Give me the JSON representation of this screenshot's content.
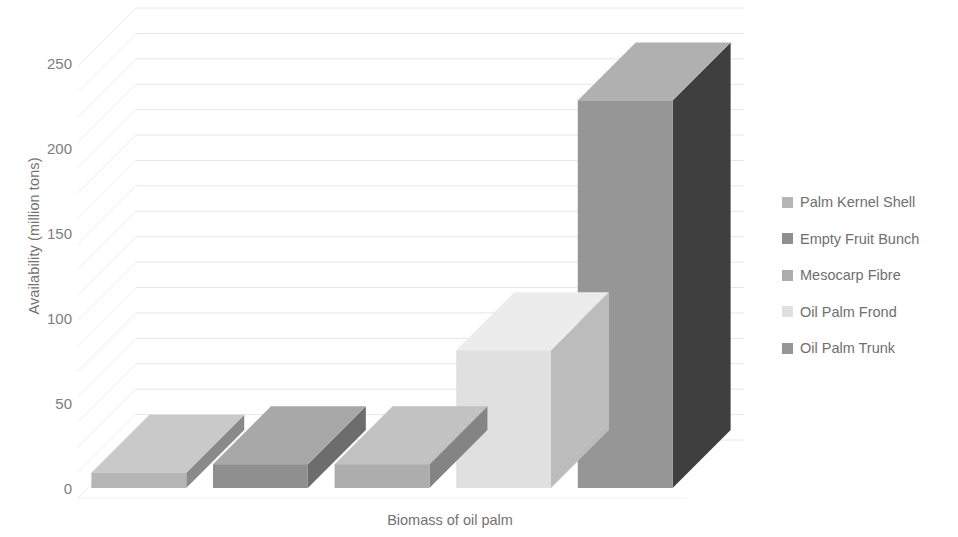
{
  "chart_data": {
    "type": "bar",
    "title": "",
    "subtitle": "",
    "xlabel": "Biomass of oil palm",
    "ylabel": "Availability (million tons)",
    "categories": [
      "Palm Kernel Shell",
      "Empty Fruit Bunch",
      "Mesocarp Fibre",
      "Oil Palm Frond",
      "Oil Palm Trunk"
    ],
    "values": [
      9,
      14,
      14,
      81,
      228
    ],
    "series": [
      {
        "name": "Availability (million tons)",
        "values": [
          9,
          14,
          14,
          81,
          228
        ]
      }
    ],
    "ylim": [
      0,
      275
    ],
    "ytick_labels": [
      "0",
      "50",
      "100",
      "150",
      "200",
      "250"
    ],
    "ytick_values": [
      0,
      50,
      100,
      150,
      200,
      250
    ],
    "grid": true,
    "grid_axis": "y",
    "legend_position": "right",
    "three_d": true,
    "bar_colors": [
      "#b5b5b5",
      "#8f8f8f",
      "#adadad",
      "#e0e0e0",
      "#969696"
    ],
    "bar_top_colors": [
      "#c9c9c9",
      "#a8a8a8",
      "#c2c2c2",
      "#ececec",
      "#b0b0b0"
    ],
    "bar_side_colors": [
      "#8a8a8a",
      "#6d6d6d",
      "#848484",
      "#bcbcbc",
      "#3f3f3f"
    ]
  },
  "axes": {
    "y_title": "Availability (million tons)",
    "x_title": "Biomass of oil palm",
    "y_ticks": [
      {
        "label": "250"
      },
      {
        "label": "200"
      },
      {
        "label": "150"
      },
      {
        "label": "100"
      },
      {
        "label": "50"
      },
      {
        "label": "0"
      }
    ]
  },
  "legend": {
    "items": [
      {
        "label": "Palm Kernel Shell",
        "color": "#b5b5b5"
      },
      {
        "label": "Empty Fruit Bunch",
        "color": "#8f8f8f"
      },
      {
        "label": "Mesocarp Fibre",
        "color": "#adadad"
      },
      {
        "label": "Oil Palm Frond",
        "color": "#e0e0e0"
      },
      {
        "label": "Oil Palm Trunk",
        "color": "#969696"
      }
    ]
  }
}
